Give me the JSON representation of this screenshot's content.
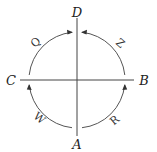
{
  "diagram": {
    "type": "circular-flow",
    "points": {
      "top": "D",
      "bottom": "A",
      "left": "C",
      "right": "B"
    },
    "arcs": [
      {
        "label": "R",
        "from": "A",
        "to": "B",
        "quadrant": "bottom-right"
      },
      {
        "label": "Z",
        "from": "B",
        "to": "D",
        "quadrant": "top-right"
      },
      {
        "label": "W",
        "from": "A",
        "to": "C",
        "quadrant": "bottom-left"
      },
      {
        "label": "Q",
        "from": "C",
        "to": "D",
        "quadrant": "top-left"
      }
    ],
    "colors": {
      "line": "#444444",
      "text": "#222222"
    }
  }
}
